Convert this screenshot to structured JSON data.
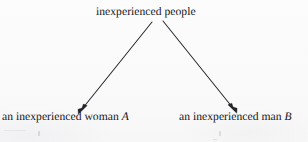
{
  "diagram": {
    "type": "tree",
    "orientation": "top-down",
    "background_color": "#fbfbfb",
    "line_color": "#2a2a2e",
    "text_color": "#15151a",
    "nodes": [
      {
        "id": "root",
        "label": "inexperienced people",
        "role": "parent-category",
        "x": 151,
        "y": 14
      },
      {
        "id": "woman",
        "label_text": "an inexperienced woman",
        "label_variable": "A",
        "label_full": "an inexperienced woman A",
        "role": "child-instance",
        "x": 72,
        "y": 119
      },
      {
        "id": "man",
        "label_text": "an inexperienced man",
        "label_variable": "B",
        "label_full": "an inexperienced man B",
        "role": "child-instance",
        "x": 243,
        "y": 119
      }
    ],
    "edges": [
      {
        "id": "edge-root-to-woman",
        "from": "root",
        "to": "woman",
        "style": "solid-arrow",
        "direction": "down-left",
        "start": [
          152,
          22
        ],
        "end": [
          79,
          113
        ]
      },
      {
        "id": "edge-root-to-man",
        "from": "root",
        "to": "man",
        "style": "solid-arrow",
        "direction": "down-right",
        "start": [
          163,
          21
        ],
        "end": [
          236,
          112
        ]
      }
    ]
  }
}
